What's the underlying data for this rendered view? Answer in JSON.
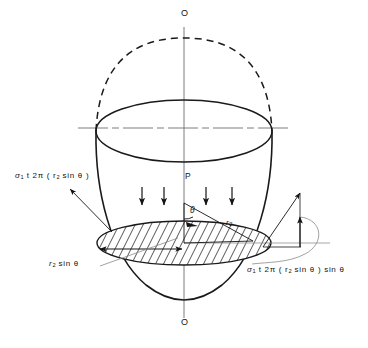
{
  "figure": {
    "type": "engineering-diagram",
    "stroke_color": "#1a1a1a",
    "background_color": "#ffffff",
    "labels": {
      "axis_top": "O",
      "axis_bottom": "O",
      "apex_point": "P",
      "radius_label": "r",
      "radius_sub": "2",
      "angle": "θ",
      "chord_label_pre": "r",
      "chord_label_sub": "2",
      "chord_label_post": " sin θ",
      "force_left_pre": "σ",
      "force_left_sub": "1",
      "force_left_post": " t 2π ( r",
      "force_left_sub2": "2",
      "force_left_tail": " sin θ )",
      "force_right_pre": "σ",
      "force_right_sub": "1",
      "force_right_post": " t 2π ( r",
      "force_right_sub2": "2",
      "force_right_tail": " sin θ ) sin θ"
    },
    "elements": {
      "dashed_arc_name": "hidden-top-arc",
      "solid_shell_name": "shell-outline",
      "ellipse_rim_name": "upper-rim-ellipse",
      "hatched_ellipse_name": "section-plane-ellipse",
      "centerline_name": "horizontal-centerline",
      "axis_name": "vertical-axis-of-revolution",
      "pressure_arrow_count": 4,
      "vector_triangle_name": "force-vector-triangle"
    }
  }
}
